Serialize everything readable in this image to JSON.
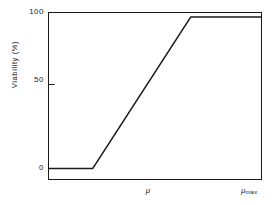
{
  "chart_data": {
    "type": "line",
    "title": "",
    "subtitle": "",
    "xlabel": "",
    "ylabel": "Viability (%)",
    "x": [
      0.0,
      0.21,
      0.67,
      1.0
    ],
    "values": [
      0,
      0,
      100,
      100
    ],
    "series": [
      {
        "name": "Viability",
        "x": [
          0.0,
          0.21,
          0.67,
          1.0
        ],
        "values": [
          0,
          0,
          100,
          100
        ]
      }
    ],
    "xlim": [
      0,
      1
    ],
    "ylim": [
      0,
      100
    ],
    "yticks": [
      0,
      50,
      100
    ],
    "ytick_labels": [
      "0",
      "50",
      "100"
    ],
    "xticks": [],
    "xtick_labels": [
      "μ",
      "μmax"
    ],
    "grid": false,
    "legend": false,
    "legend_position": "none",
    "line_color": "#1a1a1a",
    "frame_color": "#1a1a1a",
    "background": "#ffffff",
    "annotations": [
      {
        "text": "μ",
        "role": "x-axis-variable-label",
        "position": "below-axis-center"
      },
      {
        "text": "μmax",
        "role": "x-axis-endpoint-label",
        "position": "below-axis-right"
      }
    ]
  },
  "axes": {
    "y_caption": "Viability (%)",
    "y_ticks": [
      {
        "label": "100",
        "value": 100
      },
      {
        "label": "50",
        "value": 50
      },
      {
        "label": "0",
        "value": 0
      }
    ],
    "x_labels": {
      "mu": "μ",
      "mu_max_symbol": "μ",
      "mu_max_subscript": "max"
    }
  }
}
